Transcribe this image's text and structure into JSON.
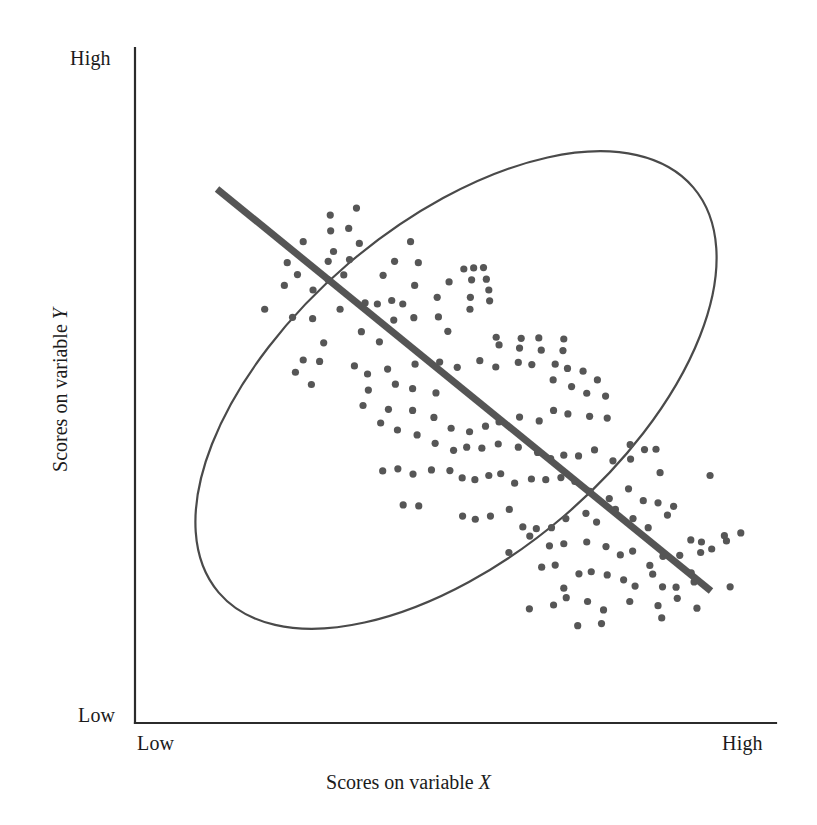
{
  "figure": {
    "width": 817,
    "height": 825,
    "background": "#ffffff"
  },
  "axes": {
    "origin": {
      "x": 135,
      "y": 723
    },
    "x_end": {
      "x": 776,
      "y": 723
    },
    "y_end": {
      "x": 135,
      "y": 48
    },
    "line_color": "#2b2b2b",
    "line_width": 2.2,
    "x_title": "Scores on variable ",
    "x_variable_symbol": "X",
    "y_title": "Scores on variable ",
    "y_variable_symbol": "Y",
    "x_tick_low": "Low",
    "x_tick_high": "High",
    "y_tick_low": "Low",
    "y_tick_high": "High"
  },
  "chart_data": {
    "type": "scatter",
    "title": "",
    "subtitle": "",
    "xlabel": "Scores on variable X",
    "ylabel": "Scores on variable Y",
    "xlim": [
      0,
      1
    ],
    "ylim": [
      0,
      1
    ],
    "xticks": [
      "Low",
      "High"
    ],
    "yticks": [
      "Low",
      "High"
    ],
    "grid": false,
    "legend": null,
    "relationship": "strong negative correlation",
    "marker": {
      "shape": "circle",
      "radius_px": 3.6,
      "color": "#565656"
    },
    "trendline": {
      "label": "regression line",
      "color": "#555555",
      "width_px": 7,
      "x1": 217,
      "y1": 189,
      "x2": 711,
      "y2": 591,
      "slope_sign": "negative"
    },
    "envelope": {
      "label": "data ellipse",
      "shape": "ellipse",
      "cx": 456,
      "cy": 390,
      "rx": 312,
      "ry": 166,
      "rotation_deg": -40.5,
      "stroke": "#4a4a4a",
      "stroke_width": 2.2,
      "fill": "none"
    },
    "points": [
      [
        460,
        166
      ],
      [
        396,
        186
      ],
      [
        397,
        231
      ],
      [
        441,
        224
      ],
      [
        330,
        262
      ],
      [
        467,
        267
      ],
      [
        404,
        290
      ],
      [
        592,
        262
      ],
      [
        291,
        322
      ],
      [
        443,
        313
      ],
      [
        391,
        318
      ],
      [
        553,
        318
      ],
      [
        611,
        322
      ],
      [
        722,
        340
      ],
      [
        746,
        337
      ],
      [
        770,
        336
      ],
      [
        316,
        356
      ],
      [
        284,
        387
      ],
      [
        354,
        400
      ],
      [
        391,
        371
      ],
      [
        429,
        357
      ],
      [
        525,
        358
      ],
      [
        602,
        387
      ],
      [
        686,
        377
      ],
      [
        741,
        371
      ],
      [
        777,
        369
      ],
      [
        236,
        455
      ],
      [
        304,
        478
      ],
      [
        353,
        482
      ],
      [
        420,
        455
      ],
      [
        481,
        437
      ],
      [
        511,
        440
      ],
      [
        546,
        430
      ],
      [
        573,
        440
      ],
      [
        657,
        421
      ],
      [
        738,
        421
      ],
      [
        785,
        431
      ],
      [
        737,
        455
      ],
      [
        783,
        400
      ],
      [
        472,
        519
      ],
      [
        380,
        551
      ],
      [
        516,
        548
      ],
      [
        551,
        486
      ],
      [
        600,
        479
      ],
      [
        660,
        477
      ],
      [
        683,
        518
      ],
      [
        801,
        535
      ],
      [
        862,
        538
      ],
      [
        905,
        537
      ],
      [
        966,
        540
      ],
      [
        808,
        557
      ],
      [
        858,
        566
      ],
      [
        911,
        572
      ],
      [
        964,
        573
      ],
      [
        330,
        600
      ],
      [
        370,
        604
      ],
      [
        311,
        635
      ],
      [
        350,
        670
      ],
      [
        455,
        617
      ],
      [
        487,
        640
      ],
      [
        536,
        626
      ],
      [
        603,
        612
      ],
      [
        663,
        606
      ],
      [
        706,
        621
      ],
      [
        761,
        602
      ],
      [
        800,
        620
      ],
      [
        855,
        607
      ],
      [
        888,
        613
      ],
      [
        945,
        612
      ],
      [
        975,
        624
      ],
      [
        1013,
        632
      ],
      [
        1048,
        657
      ],
      [
        940,
        657
      ],
      [
        985,
        676
      ],
      [
        1022,
        695
      ],
      [
        1068,
        703
      ],
      [
        489,
        686
      ],
      [
        555,
        669
      ],
      [
        597,
        682
      ],
      [
        654,
        694
      ],
      [
        476,
        730
      ],
      [
        538,
        741
      ],
      [
        597,
        744
      ],
      [
        649,
        764
      ],
      [
        691,
        795
      ],
      [
        736,
        805
      ],
      [
        775,
        789
      ],
      [
        808,
        777
      ],
      [
        858,
        763
      ],
      [
        906,
        774
      ],
      [
        941,
        744
      ],
      [
        976,
        754
      ],
      [
        1029,
        761
      ],
      [
        1072,
        766
      ],
      [
        1128,
        842
      ],
      [
        1163,
        856
      ],
      [
        1191,
        855
      ],
      [
        519,
        780
      ],
      [
        560,
        800
      ],
      [
        608,
        814
      ],
      [
        652,
        838
      ],
      [
        697,
        858
      ],
      [
        729,
        849
      ],
      [
        766,
        852
      ],
      [
        806,
        840
      ],
      [
        855,
        849
      ],
      [
        902,
        864
      ],
      [
        934,
        882
      ],
      [
        966,
        872
      ],
      [
        1002,
        874
      ],
      [
        1041,
        857
      ],
      [
        1086,
        888
      ],
      [
        1129,
        883
      ],
      [
        1201,
        922
      ],
      [
        1323,
        930
      ],
      [
        524,
        917
      ],
      [
        561,
        911
      ],
      [
        598,
        926
      ],
      [
        643,
        914
      ],
      [
        688,
        916
      ],
      [
        718,
        937
      ],
      [
        749,
        942
      ],
      [
        783,
        930
      ],
      [
        812,
        925
      ],
      [
        846,
        952
      ],
      [
        887,
        940
      ],
      [
        922,
        942
      ],
      [
        959,
        936
      ],
      [
        993,
        947
      ],
      [
        1030,
        975
      ],
      [
        1077,
        996
      ],
      [
        1124,
        968
      ],
      [
        1160,
        1002
      ],
      [
        1196,
        1008
      ],
      [
        1234,
        1018
      ],
      [
        574,
        1014
      ],
      [
        612,
        1017
      ],
      [
        719,
        1046
      ],
      [
        750,
        1055
      ],
      [
        787,
        1046
      ],
      [
        833,
        1027
      ],
      [
        866,
        1077
      ],
      [
        899,
        1082
      ],
      [
        936,
        1079
      ],
      [
        971,
        1053
      ],
      [
        1020,
        1038
      ],
      [
        1046,
        1063
      ],
      [
        1092,
        1027
      ],
      [
        1135,
        1053
      ],
      [
        1172,
        1079
      ],
      [
        1219,
        1043
      ],
      [
        1276,
        1114
      ],
      [
        1302,
        1120
      ],
      [
        1358,
        1102
      ],
      [
        1398,
        1094
      ],
      [
        1372,
        1248
      ],
      [
        832,
        1150
      ],
      [
        883,
        1103
      ],
      [
        931,
        1131
      ],
      [
        966,
        1125
      ],
      [
        1022,
        1120
      ],
      [
        1069,
        1133
      ],
      [
        1104,
        1157
      ],
      [
        1134,
        1146
      ],
      [
        1176,
        1187
      ],
      [
        1208,
        1161
      ],
      [
        1249,
        1158
      ],
      [
        1277,
        1208
      ],
      [
        1300,
        1150
      ],
      [
        1327,
        1140
      ],
      [
        1363,
        1117
      ],
      [
        912,
        1192
      ],
      [
        945,
        1186
      ],
      [
        966,
        1252
      ],
      [
        1003,
        1211
      ],
      [
        1033,
        1205
      ],
      [
        1072,
        1214
      ],
      [
        1112,
        1228
      ],
      [
        1140,
        1246
      ],
      [
        1183,
        1212
      ],
      [
        1207,
        1248
      ],
      [
        1240,
        1249
      ],
      [
        1284,
        1234
      ],
      [
        882,
        1311
      ],
      [
        941,
        1300
      ],
      [
        972,
        1279
      ],
      [
        1024,
        1290
      ],
      [
        1063,
        1314
      ],
      [
        1127,
        1290
      ],
      [
        1196,
        1302
      ],
      [
        1243,
        1281
      ],
      [
        1291,
        1309
      ],
      [
        1000,
        1359
      ],
      [
        1058,
        1353
      ],
      [
        1205,
        1337
      ]
    ]
  }
}
